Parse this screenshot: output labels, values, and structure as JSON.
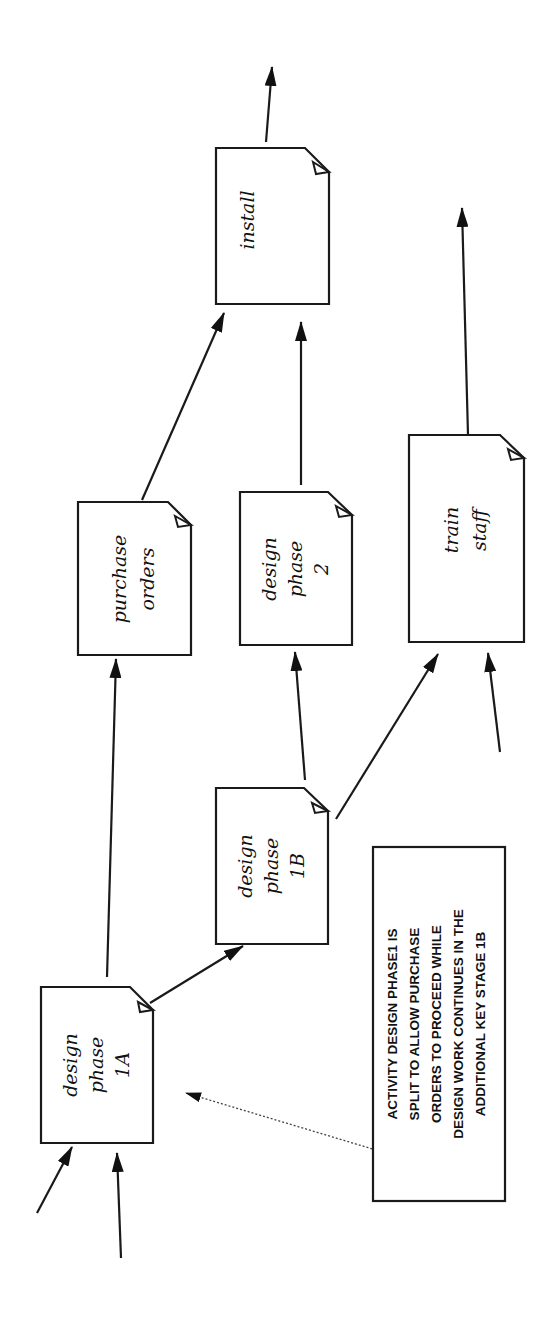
{
  "diagram": {
    "orientation": "rotated-90-ccw",
    "nodes": [
      {
        "id": "design-phase-1a",
        "lines": [
          "design",
          "phase",
          "1A"
        ]
      },
      {
        "id": "design-phase-1b",
        "lines": [
          "design",
          "phase",
          "1B"
        ]
      },
      {
        "id": "purchase-orders",
        "lines": [
          "purchase",
          "orders"
        ]
      },
      {
        "id": "design-phase-2",
        "lines": [
          "design",
          "phase",
          "2"
        ]
      },
      {
        "id": "train-staff",
        "lines": [
          "train",
          "staff"
        ]
      },
      {
        "id": "install",
        "lines": [
          "install"
        ]
      }
    ],
    "edges": [
      {
        "from": "external",
        "to": "design-phase-1a"
      },
      {
        "from": "external",
        "to": "design-phase-1a"
      },
      {
        "from": "design-phase-1a",
        "to": "purchase-orders"
      },
      {
        "from": "design-phase-1a",
        "to": "design-phase-1b"
      },
      {
        "from": "design-phase-1b",
        "to": "design-phase-2"
      },
      {
        "from": "design-phase-1b",
        "to": "train-staff"
      },
      {
        "from": "external",
        "to": "train-staff"
      },
      {
        "from": "purchase-orders",
        "to": "install"
      },
      {
        "from": "design-phase-2",
        "to": "install"
      },
      {
        "from": "install",
        "to": "external"
      },
      {
        "from": "train-staff",
        "to": "external"
      }
    ],
    "note": {
      "lines": [
        "ACTIVITY DESIGN PHASE1 IS",
        "SPLIT TO ALLOW PURCHASE",
        "ORDERS TO PROCEED  WHILE",
        "DESIGN WORK CONTINUES IN THE",
        "ADDITIONAL KEY STAGE 1B"
      ],
      "points_to": "design-phase-1a"
    },
    "colors": {
      "line": "#1a1a1a",
      "background": "#ffffff"
    }
  }
}
